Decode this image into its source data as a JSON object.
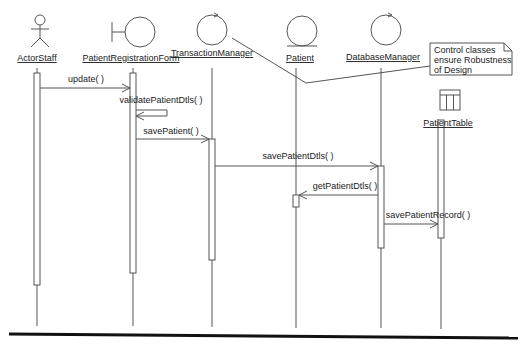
{
  "diagram": {
    "type": "sequence",
    "colors": {
      "stroke": "#555555",
      "text": "#1a1a1a",
      "bottom_rule": "#111111"
    },
    "lifelines": [
      {
        "id": "actor",
        "name": "ActorStaff",
        "stereotype": "actor",
        "x": 37
      },
      {
        "id": "form",
        "name": "PatientRegistrationForm",
        "stereotype": "boundary",
        "x": 133
      },
      {
        "id": "tm",
        "name": "TransactionManager",
        "stereotype": "control",
        "x": 212
      },
      {
        "id": "patient",
        "name": "Patient",
        "stereotype": "entity",
        "x": 296
      },
      {
        "id": "dbm",
        "name": "DatabaseManager",
        "stereotype": "control",
        "x": 381
      },
      {
        "id": "table",
        "name": "PatientTable",
        "stereotype": "table",
        "x": 441
      }
    ],
    "messages": [
      {
        "label": "update( )",
        "from": "ActorStaff",
        "to": "PatientRegistrationForm"
      },
      {
        "label": "validatePatientDtls( )",
        "from": "PatientRegistrationForm",
        "to": "PatientRegistrationForm"
      },
      {
        "label": "savePatient( )",
        "from": "PatientRegistrationForm",
        "to": "TransactionManager"
      },
      {
        "label": "savePatientDtls( )",
        "from": "TransactionManager",
        "to": "DatabaseManager"
      },
      {
        "label": "getPatientDtls( )",
        "from": "DatabaseManager",
        "to": "Patient"
      },
      {
        "label": "savePatientRecord( )",
        "from": "DatabaseManager",
        "to": "PatientTable"
      }
    ],
    "note": {
      "lines": [
        "Control classes",
        "ensure Robustness",
        "of Design"
      ]
    }
  }
}
